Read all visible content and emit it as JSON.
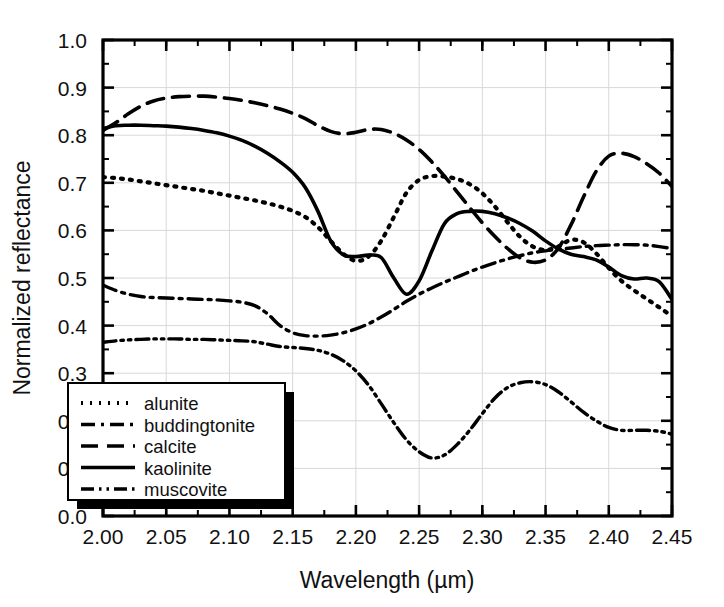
{
  "figure": {
    "background": "#ffffff",
    "foreground": "#000000",
    "gridline_color": "#d8d8d8"
  },
  "chart_data": {
    "type": "line",
    "title": "",
    "xlabel": "Wavelength (µm)",
    "ylabel": "Normalized reflectance",
    "xlim": [
      2.0,
      2.45
    ],
    "ylim": [
      0.0,
      1.0
    ],
    "grid": true,
    "legend_position": "lower-left",
    "xticks": [
      2.0,
      2.05,
      2.1,
      2.15,
      2.2,
      2.25,
      2.3,
      2.35,
      2.4,
      2.45
    ],
    "xticklabels": [
      "2.00",
      "2.05",
      "2.10",
      "2.15",
      "2.20",
      "2.25",
      "2.30",
      "2.35",
      "2.40",
      "2.45"
    ],
    "xminor_step": 0.025,
    "yticks": [
      0.0,
      0.1,
      0.2,
      0.3,
      0.4,
      0.5,
      0.6,
      0.7,
      0.8,
      0.9,
      1.0
    ],
    "yticklabels": [
      "0.0",
      "0.1",
      "0.2",
      "0.3",
      "0.4",
      "0.5",
      "0.6",
      "0.7",
      "0.8",
      "0.9",
      "1.0"
    ],
    "yminor_step": 0.05,
    "x": [
      2.0,
      2.01,
      2.02,
      2.03,
      2.04,
      2.05,
      2.06,
      2.07,
      2.08,
      2.09,
      2.1,
      2.11,
      2.12,
      2.13,
      2.14,
      2.15,
      2.16,
      2.17,
      2.18,
      2.19,
      2.2,
      2.21,
      2.22,
      2.23,
      2.24,
      2.25,
      2.26,
      2.27,
      2.28,
      2.29,
      2.3,
      2.31,
      2.32,
      2.33,
      2.34,
      2.35,
      2.36,
      2.37,
      2.38,
      2.39,
      2.4,
      2.41,
      2.42,
      2.43,
      2.44,
      2.45
    ],
    "series": [
      {
        "name": "alunite",
        "dash_style": "dotted",
        "dasharray": "2,7",
        "width": 4.2,
        "values": [
          0.712,
          0.71,
          0.707,
          0.703,
          0.699,
          0.695,
          0.691,
          0.687,
          0.683,
          0.678,
          0.673,
          0.668,
          0.663,
          0.657,
          0.65,
          0.641,
          0.628,
          0.607,
          0.578,
          0.551,
          0.536,
          0.545,
          0.578,
          0.628,
          0.679,
          0.706,
          0.714,
          0.713,
          0.708,
          0.697,
          0.678,
          0.65,
          0.617,
          0.586,
          0.566,
          0.559,
          0.566,
          0.58,
          0.575,
          0.552,
          0.521,
          0.494,
          0.474,
          0.456,
          0.438,
          0.42
        ]
      },
      {
        "name": "buddingtonite",
        "dash_style": "dash-dot",
        "dasharray": "14,6,3,6",
        "width": 3.4,
        "values": [
          0.485,
          0.474,
          0.466,
          0.461,
          0.459,
          0.458,
          0.457,
          0.456,
          0.455,
          0.454,
          0.452,
          0.449,
          0.442,
          0.425,
          0.4,
          0.385,
          0.379,
          0.378,
          0.38,
          0.385,
          0.393,
          0.404,
          0.418,
          0.434,
          0.451,
          0.466,
          0.479,
          0.491,
          0.502,
          0.513,
          0.523,
          0.532,
          0.54,
          0.547,
          0.553,
          0.557,
          0.56,
          0.563,
          0.566,
          0.568,
          0.569,
          0.57,
          0.57,
          0.569,
          0.566,
          0.562
        ]
      },
      {
        "name": "calcite",
        "dash_style": "dashed",
        "dasharray": "17,9",
        "width": 3.6,
        "values": [
          0.81,
          0.826,
          0.845,
          0.861,
          0.872,
          0.878,
          0.881,
          0.882,
          0.882,
          0.88,
          0.877,
          0.873,
          0.868,
          0.862,
          0.855,
          0.846,
          0.835,
          0.82,
          0.808,
          0.803,
          0.806,
          0.812,
          0.812,
          0.804,
          0.79,
          0.77,
          0.744,
          0.714,
          0.681,
          0.648,
          0.616,
          0.587,
          0.562,
          0.542,
          0.533,
          0.538,
          0.562,
          0.611,
          0.67,
          0.724,
          0.756,
          0.762,
          0.755,
          0.74,
          0.72,
          0.692
        ]
      },
      {
        "name": "kaolinite",
        "dash_style": "solid",
        "dasharray": "",
        "width": 3.6,
        "values": [
          0.814,
          0.82,
          0.821,
          0.821,
          0.82,
          0.819,
          0.817,
          0.814,
          0.81,
          0.805,
          0.798,
          0.789,
          0.777,
          0.762,
          0.744,
          0.722,
          0.69,
          0.64,
          0.578,
          0.549,
          0.545,
          0.548,
          0.543,
          0.5,
          0.466,
          0.494,
          0.556,
          0.614,
          0.635,
          0.64,
          0.64,
          0.635,
          0.626,
          0.614,
          0.598,
          0.578,
          0.561,
          0.55,
          0.545,
          0.538,
          0.523,
          0.505,
          0.498,
          0.5,
          0.492,
          0.455
        ]
      },
      {
        "name": "muscovite",
        "dash_style": "dash-dot-dot",
        "dasharray": "13,5,2.5,5,2.5,5",
        "width": 3.4,
        "values": [
          0.365,
          0.368,
          0.37,
          0.371,
          0.372,
          0.372,
          0.372,
          0.371,
          0.371,
          0.37,
          0.369,
          0.368,
          0.366,
          0.361,
          0.356,
          0.354,
          0.352,
          0.348,
          0.34,
          0.326,
          0.305,
          0.275,
          0.236,
          0.196,
          0.16,
          0.135,
          0.122,
          0.128,
          0.15,
          0.18,
          0.215,
          0.248,
          0.27,
          0.28,
          0.282,
          0.276,
          0.261,
          0.24,
          0.218,
          0.2,
          0.186,
          0.18,
          0.18,
          0.18,
          0.178,
          0.172
        ]
      }
    ],
    "legend_entries": [
      {
        "label": "alunite",
        "dasharray": "2,7",
        "width": 4.2
      },
      {
        "label": "buddingtonite",
        "dasharray": "14,6,3,6",
        "width": 3.4
      },
      {
        "label": "calcite",
        "dasharray": "17,9",
        "width": 3.6
      },
      {
        "label": "kaolinite",
        "dasharray": "",
        "width": 3.6
      },
      {
        "label": "muscovite",
        "dasharray": "13,5,2.5,5,2.5,5",
        "width": 3.4
      }
    ]
  }
}
